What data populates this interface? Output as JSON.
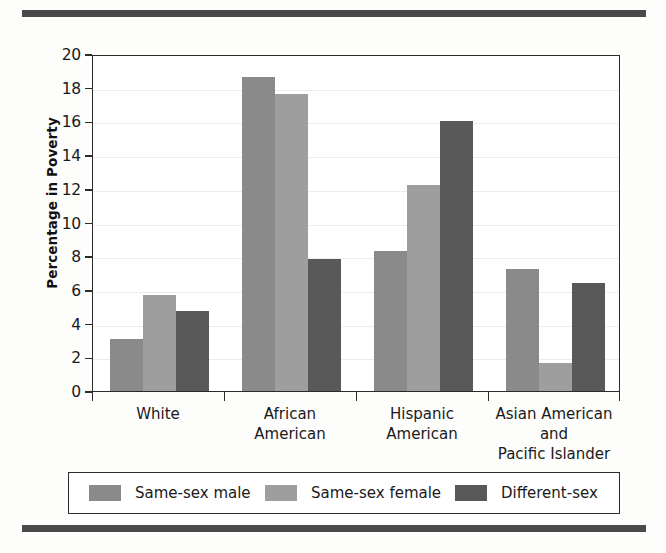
{
  "chart_data": {
    "type": "bar",
    "title": "",
    "subtitle": "",
    "xlabel": "",
    "ylabel": "Percentage in Poverty",
    "ylim": [
      0,
      20
    ],
    "ytick_step": 2,
    "yticks": [
      20,
      18,
      16,
      14,
      12,
      10,
      8,
      6,
      4,
      2,
      0
    ],
    "grid": true,
    "grid_axis": "y",
    "legend_position": "bottom",
    "categories": [
      "White",
      "African American",
      "Hispanic American",
      "Asian American and Pacific Islander"
    ],
    "category_lines": [
      [
        "White"
      ],
      [
        "African",
        "American"
      ],
      [
        "Hispanic",
        "American"
      ],
      [
        "Asian American and",
        "Pacific Islander"
      ]
    ],
    "series": [
      {
        "name": "Same-sex male",
        "color": "#8a8a8a",
        "values": [
          3.1,
          18.65,
          8.3,
          7.25
        ]
      },
      {
        "name": "Same-sex female",
        "color": "#9e9e9e",
        "values": [
          5.7,
          17.65,
          12.2,
          1.65
        ]
      },
      {
        "name": "Different-sex",
        "color": "#595959",
        "values": [
          4.75,
          7.85,
          16.05,
          6.4
        ]
      }
    ]
  },
  "axis": {
    "y_title": "Percentage in Poverty"
  },
  "legend": {
    "items": [
      {
        "label": "Same-sex male",
        "color": "#8a8a8a"
      },
      {
        "label": "Same-sex female",
        "color": "#9e9e9e"
      },
      {
        "label": "Different-sex",
        "color": "#595959"
      }
    ]
  },
  "colors": {
    "rule": "#4a4a4a",
    "frame": "#2b2b2b",
    "grid": "#ececec",
    "text": "#1a1a1a",
    "background": "#fdfdfc"
  }
}
